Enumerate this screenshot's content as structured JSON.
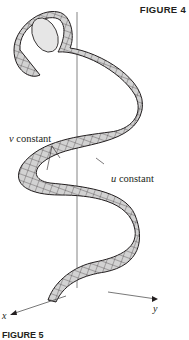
{
  "figure": {
    "title": "FIGURE 4",
    "bottom_caption": "FIGURE 5"
  },
  "annotations": {
    "v_constant": {
      "var": "v",
      "text": " constant"
    },
    "u_constant": {
      "var": "u",
      "text": " constant"
    }
  },
  "axes": {
    "x_label": "x",
    "y_label": "y"
  },
  "colors": {
    "surface_fill": "#d4d4d4",
    "mesh": "#231f20",
    "axis": "#555555"
  }
}
